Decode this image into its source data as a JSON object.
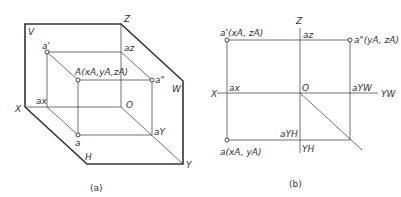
{
  "figure_a": {
    "caption": "(a)",
    "plane_labels": {
      "V": "V",
      "W": "W",
      "H": "H"
    },
    "axis_labels": {
      "X": "X",
      "Y": "Y",
      "Z": "Z",
      "O": "O"
    },
    "point_labels": {
      "A": "A(xA,yA,zA)",
      "a_prime": "a'",
      "a_double_prime": "a\"",
      "a": "a",
      "a_x": "ax",
      "a_z": "az",
      "a_y": "aY"
    }
  },
  "figure_b": {
    "caption": "(b)",
    "axis_labels": {
      "X": "X",
      "Z": "Z",
      "O": "O",
      "Y_W": "YW",
      "Y_H": "YH"
    },
    "point_labels": {
      "a_prime": "a'(xA, zA)",
      "a_double_prime": "a\"(yA, zA)",
      "a": "a(xA, yA)",
      "a_x": "ax",
      "a_z": "az",
      "a_YW": "aYW",
      "a_YH": "aYH"
    }
  }
}
